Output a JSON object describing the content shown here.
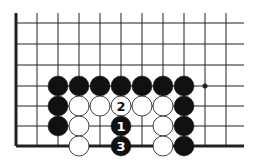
{
  "board": {
    "colors": {
      "background": "#ffffff",
      "line": "#222222",
      "black": "#111111",
      "white": "#ffffff"
    },
    "columns_x": [
      16,
      37,
      58,
      79,
      100,
      121,
      142,
      163,
      184,
      205,
      226
    ],
    "rows_y": [
      23,
      44,
      65,
      86,
      106,
      126,
      146
    ],
    "line_top": 13,
    "line_right": 244,
    "left_edge_x": 16,
    "bottom_edge_y": 146,
    "star_point": {
      "x": 205,
      "y": 86
    },
    "stone_radius": 10
  },
  "stones": [
    {
      "color": "black",
      "x": 58,
      "y": 86
    },
    {
      "color": "black",
      "x": 79,
      "y": 86
    },
    {
      "color": "black",
      "x": 100,
      "y": 86
    },
    {
      "color": "black",
      "x": 121,
      "y": 86
    },
    {
      "color": "black",
      "x": 142,
      "y": 86
    },
    {
      "color": "black",
      "x": 163,
      "y": 86
    },
    {
      "color": "black",
      "x": 184,
      "y": 86
    },
    {
      "color": "black",
      "x": 58,
      "y": 106
    },
    {
      "color": "white",
      "x": 79,
      "y": 106
    },
    {
      "color": "white",
      "x": 100,
      "y": 106
    },
    {
      "color": "white",
      "x": 121,
      "y": 106,
      "label": "2"
    },
    {
      "color": "white",
      "x": 142,
      "y": 106
    },
    {
      "color": "white",
      "x": 163,
      "y": 106
    },
    {
      "color": "black",
      "x": 184,
      "y": 106
    },
    {
      "color": "black",
      "x": 58,
      "y": 126
    },
    {
      "color": "white",
      "x": 79,
      "y": 126
    },
    {
      "color": "black",
      "x": 121,
      "y": 126,
      "label": "1"
    },
    {
      "color": "white",
      "x": 163,
      "y": 126
    },
    {
      "color": "black",
      "x": 184,
      "y": 126
    },
    {
      "color": "white",
      "x": 79,
      "y": 146
    },
    {
      "color": "black",
      "x": 121,
      "y": 146,
      "label": "3"
    },
    {
      "color": "white",
      "x": 163,
      "y": 146
    },
    {
      "color": "black",
      "x": 184,
      "y": 146
    }
  ]
}
